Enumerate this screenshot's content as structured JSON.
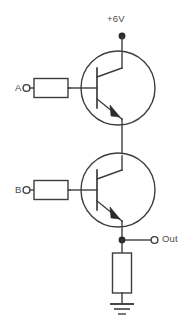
{
  "diagram": {
    "type": "schematic",
    "background_color": "#ffffff",
    "line_color": "#3e3e3e",
    "labels": {
      "supply": "+6V",
      "input_a": "A",
      "input_b": "B",
      "output": "Out"
    },
    "nodes": {
      "supply_terminal": "filled-dot",
      "input_a_terminal": "open-circle",
      "input_b_terminal": "open-circle",
      "output_terminal": "open-circle",
      "output_junction": "filled-dot",
      "ground_symbol": "earth-ground-3-bar"
    },
    "components": [
      {
        "name": "base-resistor-a",
        "type": "resistor",
        "orientation": "horizontal",
        "connects": [
          "input_a_terminal",
          "q1_base"
        ]
      },
      {
        "name": "transistor-q1",
        "type": "npn-transistor",
        "collector": "supply_terminal",
        "base": "base-resistor-a",
        "emitter": "q2_collector"
      },
      {
        "name": "base-resistor-b",
        "type": "resistor",
        "orientation": "horizontal",
        "connects": [
          "input_b_terminal",
          "q2_base"
        ]
      },
      {
        "name": "transistor-q2",
        "type": "npn-transistor",
        "collector": "q1_emitter",
        "base": "base-resistor-b",
        "emitter": "output_junction"
      },
      {
        "name": "emitter-resistor",
        "type": "resistor",
        "orientation": "vertical",
        "connects": [
          "output_junction",
          "ground_symbol"
        ]
      }
    ]
  }
}
